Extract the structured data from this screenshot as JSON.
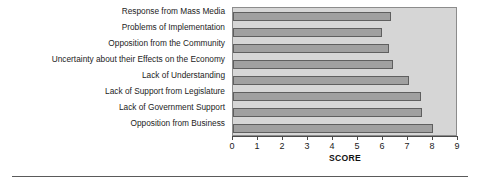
{
  "chart_data": {
    "type": "bar",
    "orientation": "horizontal",
    "title": "",
    "xlabel": "SCORE",
    "ylabel": "",
    "xlim": [
      0,
      9
    ],
    "ylim": null,
    "grid": false,
    "legend": null,
    "xticks": [
      "0",
      "1",
      "2",
      "3",
      "4",
      "5",
      "6",
      "7",
      "8",
      "9"
    ],
    "categories": [
      "Response from Mass Media",
      "Problems of Implementation",
      "Opposition from the Community",
      "Uncertainty about their Effects on the Economy",
      "Lack of Understanding",
      "Lack of Support from Legislature",
      "Lack of Government Support",
      "Opposition from Business"
    ],
    "values": [
      6.3,
      5.95,
      6.25,
      6.4,
      7.05,
      7.5,
      7.55,
      8.0
    ],
    "colors": {
      "bar_fill": "#a0a0a0",
      "bar_edge": "#5f5f5f",
      "plot_background": "#d6d6d6",
      "plot_border": "#8c8c8c",
      "axis": "#4a4a4a",
      "text": "#1c1c1c",
      "page_background": "#ffffff"
    }
  }
}
